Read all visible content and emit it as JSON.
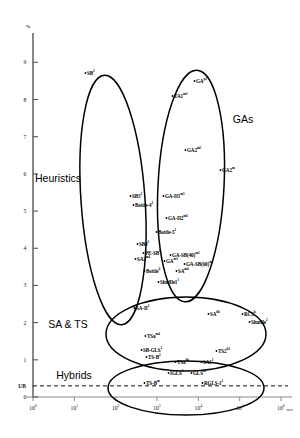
{
  "chart_data": {
    "type": "scatter",
    "title": "",
    "xlabel": "sec",
    "ylabel": "%",
    "xscale": "log",
    "xlim": [
      1,
      1000000
    ],
    "ylim": [
      0,
      9.6
    ],
    "grid": false,
    "legend_position": "none",
    "x_ticks": [
      "10⁰",
      "10¹",
      "10²",
      "10³",
      "10⁴",
      "10⁵",
      "10⁶"
    ],
    "x_tick_values": [
      1,
      10,
      100,
      1000,
      10000,
      100000,
      1000000
    ],
    "y_ticks": [
      "9",
      "8",
      "7",
      "6",
      "5",
      "4",
      "3",
      "2",
      "1",
      "0"
    ],
    "y_tick_values": [
      9,
      8,
      7,
      6,
      5,
      4,
      3,
      2,
      1,
      0
    ],
    "reference_line": {
      "label": "UB",
      "y": 0.3,
      "style": "dashed"
    },
    "clusters": [
      {
        "name": "Heuristics",
        "label_x": 58,
        "label_y": 178,
        "cx": 113,
        "cy": 200,
        "rx": 32,
        "ry": 125,
        "rot": -4
      },
      {
        "name": "GAs",
        "label_x": 243,
        "label_y": 119,
        "cx": 191,
        "cy": 186,
        "rx": 33,
        "ry": 116,
        "rot": 3
      },
      {
        "name": "SA & TS",
        "label_x": 68,
        "label_y": 324,
        "cx": 186,
        "cy": 334,
        "rx": 80,
        "ry": 37,
        "rot": 0
      },
      {
        "name": "Hybrids",
        "label_x": 74,
        "label_y": 375,
        "cx": 186,
        "cy": 388,
        "rx": 78,
        "ry": 27,
        "rot": 0
      }
    ],
    "points": [
      {
        "label": "SB",
        "sup": "1",
        "x": 87,
        "y": 73,
        "anchor": "left"
      },
      {
        "label": "GA",
        "sup": "p3",
        "x": 196,
        "y": 81,
        "anchor": "left"
      },
      {
        "label": "TA1",
        "sup": "m3",
        "x": 174,
        "y": 96,
        "anchor": "left"
      },
      {
        "label": "GA2",
        "sup": "m5",
        "x": 187,
        "y": 150,
        "anchor": "left"
      },
      {
        "label": "GA2",
        "sup": "m",
        "x": 222,
        "y": 170,
        "anchor": "left"
      },
      {
        "label": "SB3",
        "sup": "1",
        "x": 132,
        "y": 196,
        "anchor": "left"
      },
      {
        "label": "GA-II1",
        "sup": "m5",
        "x": 165,
        "y": 196,
        "anchor": "left"
      },
      {
        "label": "Bottle-4",
        "sup": "1",
        "x": 135,
        "y": 205,
        "anchor": "left"
      },
      {
        "label": "GA-II2",
        "sup": "m6",
        "x": 168,
        "y": 218,
        "anchor": "left"
      },
      {
        "label": "Bottle-5",
        "sup": "1",
        "x": 158,
        "y": 232,
        "anchor": "left"
      },
      {
        "label": "SB4",
        "sup": "1",
        "x": 139,
        "y": 244,
        "anchor": "left"
      },
      {
        "label": "PE-SB",
        "sup": "1",
        "x": 145,
        "y": 253,
        "anchor": "left"
      },
      {
        "label": "GA-SB(40)",
        "sup": "m2",
        "x": 172,
        "y": 255,
        "anchor": "left"
      },
      {
        "label": "SA2",
        "sup": "m4",
        "x": 137,
        "y": 259,
        "anchor": "left"
      },
      {
        "label": "GA",
        "sup": "m1",
        "x": 166,
        "y": 261,
        "anchor": "left"
      },
      {
        "label": "GA-SB(60)",
        "sup": "m",
        "x": 186,
        "y": 264,
        "anchor": "left"
      },
      {
        "label": "Bottle",
        "sup": "4",
        "x": 146,
        "y": 271,
        "anchor": "left"
      },
      {
        "label": "SA",
        "sup": "m4",
        "x": 178,
        "y": 271,
        "anchor": "left"
      },
      {
        "label": "Shuffle1",
        "sup": "1",
        "x": 160,
        "y": 282,
        "anchor": "left"
      },
      {
        "label": "SA-II",
        "sup": "1",
        "x": 136,
        "y": 308,
        "anchor": "left"
      },
      {
        "label": "SA",
        "sup": "h6",
        "x": 210,
        "y": 314,
        "anchor": "left"
      },
      {
        "label": "RCS",
        "sup": "k",
        "x": 244,
        "y": 314,
        "anchor": "left"
      },
      {
        "label": "Shuffle",
        "sup": "2",
        "x": 251,
        "y": 322,
        "anchor": "left"
      },
      {
        "label": "TSa",
        "sup": "m4",
        "x": 147,
        "y": 336,
        "anchor": "left"
      },
      {
        "label": "SB-GLS",
        "sup": "1",
        "x": 143,
        "y": 350,
        "anchor": "left"
      },
      {
        "label": "TS2",
        "sup": "h3",
        "x": 218,
        "y": 351,
        "anchor": "left"
      },
      {
        "label": "TS-B",
        "sup": "2",
        "x": 148,
        "y": 357,
        "anchor": "left"
      },
      {
        "label": "TSa",
        "sup": "h6",
        "x": 177,
        "y": 362,
        "anchor": "left"
      },
      {
        "label": "SA1",
        "sup": "1",
        "x": 203,
        "y": 362,
        "anchor": "left"
      },
      {
        "label": "IGLS",
        "sup": "2",
        "x": 170,
        "y": 373,
        "anchor": "left"
      },
      {
        "label": "GLS",
        "sup": "k1",
        "x": 193,
        "y": 373,
        "anchor": "left"
      },
      {
        "label": "TS-B",
        "sup": "m",
        "x": 146,
        "y": 383,
        "anchor": "left"
      },
      {
        "label": "RGLS-1",
        "sup": "1",
        "x": 204,
        "y": 383,
        "anchor": "left"
      }
    ]
  },
  "axes": {
    "y_unit": "%",
    "x_unit": "sec"
  }
}
